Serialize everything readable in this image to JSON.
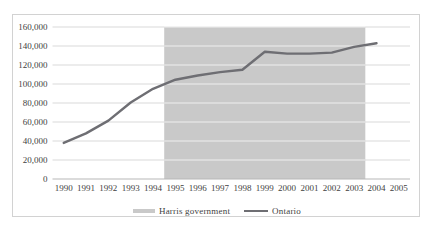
{
  "chart_data": {
    "type": "line",
    "title": "",
    "xlabel": "",
    "ylabel": "",
    "categories": [
      "1990",
      "1991",
      "1992",
      "1993",
      "1994",
      "1995",
      "1996",
      "1997",
      "1998",
      "1999",
      "2000",
      "2001",
      "2002",
      "2003",
      "2004",
      "2005"
    ],
    "series": [
      {
        "name": "Ontario",
        "color": "#6e6e73",
        "values": [
          38000,
          48000,
          61500,
          80500,
          95000,
          104500,
          109000,
          112500,
          115000,
          134000,
          132000,
          132000,
          133000,
          139000,
          143000,
          null
        ]
      }
    ],
    "band": {
      "name": "Harris government",
      "from_category": "1995",
      "to_category": "2003",
      "color": "#c9c9c9"
    },
    "ylim": [
      0,
      160000
    ],
    "ytick_step": 20000,
    "ytick_labels": [
      "0",
      "20,000",
      "40,000",
      "60,000",
      "80,000",
      "100,000",
      "120,000",
      "140,000",
      "160,000"
    ],
    "grid": "horizontal",
    "gridline_color": "#d9d9d9",
    "band_gridline_color": "rgba(255,255,255,0.7)",
    "axis_line_color": "#b7b7b7",
    "label_color": "#3f3f3f",
    "frame_border_color": "#d2d2d2",
    "legend_position": "bottom"
  },
  "legend": {
    "items": [
      {
        "label": "Harris government",
        "swatch": "area"
      },
      {
        "label": "Ontario",
        "swatch": "line"
      }
    ]
  }
}
